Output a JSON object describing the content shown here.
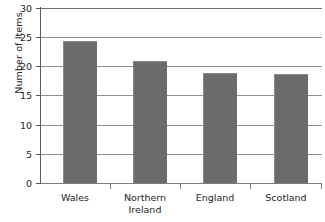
{
  "chart_data": {
    "type": "bar",
    "title": "",
    "xlabel": "",
    "ylabel": "Number of Items",
    "categories": [
      "Wales",
      "Northern Ireland",
      "England",
      "Scotland"
    ],
    "category_lines": [
      [
        "Wales"
      ],
      [
        "Northern",
        "Ireland"
      ],
      [
        "England"
      ],
      [
        "Scotland"
      ]
    ],
    "values": [
      24.4,
      20.9,
      18.8,
      18.6
    ],
    "ylim": [
      0,
      30
    ],
    "ytick_values": [
      0,
      5,
      10,
      15,
      20,
      25,
      30
    ],
    "ytick_labels": [
      "0",
      "5",
      "10",
      "15",
      "20",
      "25",
      "30"
    ],
    "grid": "horizontal",
    "legend": "none",
    "bar_color": "#6b6b6b",
    "grid_color": "#8f8f8f",
    "axis_color": "#5c5c5c",
    "text_color": "#262626"
  }
}
